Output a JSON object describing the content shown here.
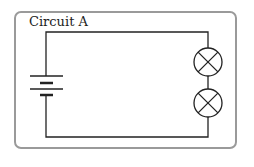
{
  "diagram": {
    "title": "Circuit A",
    "components": [
      {
        "type": "battery",
        "cells": 2
      },
      {
        "type": "lamp",
        "index": 1
      },
      {
        "type": "lamp",
        "index": 2
      }
    ],
    "connection": "series",
    "colors": {
      "wire": "#222222",
      "border": "#9a9a9a"
    }
  }
}
